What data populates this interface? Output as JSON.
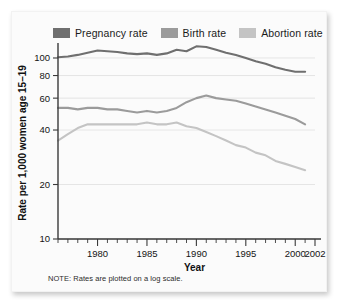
{
  "note": "NOTE: Rates are plotted on a log scale.",
  "legend": {
    "items": [
      {
        "label": "Pregnancy rate",
        "color": "#6f6f6f"
      },
      {
        "label": "Birth rate",
        "color": "#9b9b9b"
      },
      {
        "label": "Abortion rate",
        "color": "#c4c4c4"
      }
    ]
  },
  "chart_data": {
    "type": "line",
    "title": "",
    "xlabel": "Year",
    "ylabel": "Rate per 1,000 women age 15–19",
    "yscale": "log",
    "ylim": [
      10,
      115
    ],
    "xlim": [
      1976,
      2002
    ],
    "yticks": [
      10,
      20,
      40,
      60,
      80,
      100
    ],
    "ytick_labels": [
      "10",
      "20",
      "40",
      "60",
      "80",
      "100"
    ],
    "xticks": [
      1980,
      1985,
      1990,
      1995,
      2000,
      2002
    ],
    "xtick_labels": [
      "1980",
      "1985",
      "1990",
      "1995",
      "2000",
      "2002"
    ],
    "xminor_ticks": [
      1976,
      1977,
      1978,
      1979,
      1981,
      1982,
      1983,
      1984,
      1986,
      1987,
      1988,
      1989,
      1991,
      1992,
      1993,
      1994,
      1996,
      1997,
      1998,
      1999,
      2001
    ],
    "grid": true,
    "legend_position": "top",
    "x": [
      1976,
      1977,
      1978,
      1979,
      1980,
      1981,
      1982,
      1983,
      1984,
      1985,
      1986,
      1987,
      1988,
      1989,
      1990,
      1991,
      1992,
      1993,
      1994,
      1995,
      1996,
      1997,
      1998,
      1999,
      2000,
      2001
    ],
    "series": [
      {
        "name": "Pregnancy rate",
        "color": "#6f6f6f",
        "values": [
          101,
          102,
          104,
          107,
          110,
          109,
          108,
          106,
          105,
          106,
          104,
          106,
          111,
          109,
          116,
          115,
          111,
          107,
          104,
          100,
          96,
          93,
          89,
          86,
          84,
          84
        ]
      },
      {
        "name": "Birth rate",
        "color": "#9b9b9b",
        "values": [
          53,
          53,
          52,
          53,
          53,
          52,
          52,
          51,
          50,
          51,
          50,
          51,
          53,
          57,
          60,
          62,
          60,
          59,
          58,
          56,
          54,
          52,
          50,
          48,
          46,
          43
        ]
      },
      {
        "name": "Abortion rate",
        "color": "#c4c4c4",
        "values": [
          35,
          38,
          41,
          43,
          43,
          43,
          43,
          43,
          43,
          44,
          43,
          43,
          44,
          42,
          41,
          39,
          37,
          35,
          33,
          32,
          30,
          29,
          27,
          26,
          25,
          24
        ]
      }
    ]
  }
}
